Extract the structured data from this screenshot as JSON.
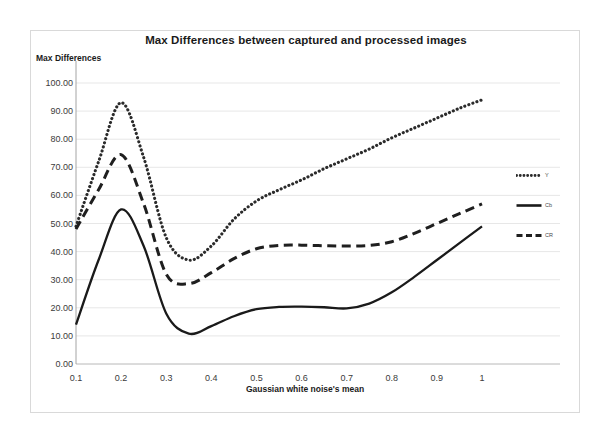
{
  "chart_data": {
    "type": "line",
    "title": "Max Differences between captured and processed images",
    "xlabel": "Gaussian white noise's mean",
    "ylabel": "Max Differences",
    "xlim": [
      0.1,
      1.0
    ],
    "ylim": [
      0.0,
      100.0
    ],
    "grid": true,
    "legend_position": "right",
    "x_tick_labels": [
      "0.1",
      "0.2",
      "0.3",
      "0.4",
      "0.5",
      "0.6",
      "0.7",
      "0.8",
      "0.9",
      "1"
    ],
    "x": [
      0.1,
      0.2,
      0.3,
      0.4,
      0.5,
      0.6,
      0.7,
      0.8,
      0.9,
      1.0
    ],
    "y_tick_labels": [
      "100.00",
      "90.00",
      "80.00",
      "70.00",
      "60.00",
      "50.00",
      "40.00",
      "30.00",
      "20.00",
      "10.00",
      "0.00"
    ],
    "y_ticks": [
      100.0,
      90.0,
      80.0,
      70.0,
      60.0,
      50.0,
      40.0,
      30.0,
      20.0,
      10.0,
      0.0
    ],
    "series": [
      {
        "name": "Y",
        "style": "dotted",
        "color": "#2b2b2b",
        "x": [
          0.1,
          0.15,
          0.2,
          0.25,
          0.3,
          0.35,
          0.4,
          0.45,
          0.5,
          0.55,
          0.6,
          0.65,
          0.7,
          0.75,
          0.8,
          0.85,
          0.9,
          0.95,
          1.0
        ],
        "values": [
          49.0,
          72.0,
          93.0,
          73.5,
          45.0,
          37.0,
          42.0,
          51.5,
          58.0,
          62.0,
          65.5,
          69.5,
          73.0,
          76.5,
          80.5,
          84.0,
          87.5,
          91.0,
          94.0
        ]
      },
      {
        "name": "Cb",
        "style": "solid",
        "color": "#1a1a1a",
        "x": [
          0.1,
          0.15,
          0.2,
          0.25,
          0.3,
          0.35,
          0.4,
          0.45,
          0.5,
          0.55,
          0.6,
          0.65,
          0.7,
          0.75,
          0.8,
          0.85,
          0.9,
          0.95,
          1.0
        ],
        "values": [
          14.0,
          37.0,
          55.0,
          42.0,
          18.0,
          10.8,
          13.5,
          17.0,
          19.5,
          20.3,
          20.4,
          20.2,
          19.8,
          21.5,
          25.5,
          31.0,
          37.0,
          43.0,
          49.0
        ]
      },
      {
        "name": "CR",
        "style": "dashed",
        "color": "#1f1f1f",
        "x": [
          0.1,
          0.15,
          0.2,
          0.25,
          0.3,
          0.35,
          0.4,
          0.45,
          0.5,
          0.55,
          0.6,
          0.65,
          0.7,
          0.75,
          0.8,
          0.85,
          0.9,
          0.95,
          1.0
        ],
        "values": [
          48.0,
          62.0,
          74.5,
          57.0,
          32.0,
          28.6,
          32.5,
          37.5,
          41.0,
          42.2,
          42.3,
          42.1,
          42.0,
          42.2,
          43.5,
          46.5,
          50.0,
          53.5,
          57.0
        ]
      }
    ]
  }
}
